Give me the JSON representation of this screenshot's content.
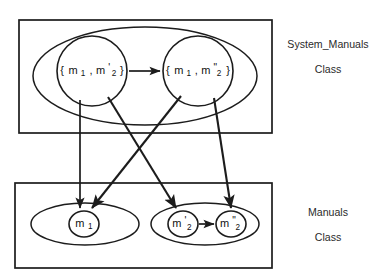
{
  "diagram": {
    "type": "set-mapping-diagram",
    "stroke_color": "#1c1c1c",
    "background_color": "#ffffff",
    "containers": [
      {
        "id": "system-manuals-box",
        "label_line1": "System_Manuals",
        "label_line2": "Class"
      },
      {
        "id": "manuals-box",
        "label_line1": "Manuals",
        "label_line2": "Class"
      }
    ],
    "nodes": {
      "top_left": {
        "id": "set-m1-m2prime",
        "open_brace": "{",
        "close_brace": "}",
        "base1": "m",
        "sub1": "1",
        "separator": ",",
        "base2": "m",
        "prime2": "'",
        "sub2": "2"
      },
      "top_right": {
        "id": "set-m1-m2doubleprime",
        "open_brace": "{",
        "close_brace": "}",
        "base1": "m",
        "sub1": "1",
        "separator": ",",
        "base2": "m",
        "prime2": "\"",
        "sub2": "2"
      },
      "bottom_left": {
        "id": "element-m1",
        "base": "m",
        "prime": "",
        "sub": "1"
      },
      "bottom_mid": {
        "id": "element-m2prime",
        "base": "m",
        "prime": "'",
        "sub": "2"
      },
      "bottom_right": {
        "id": "element-m2doubleprime",
        "base": "m",
        "prime": "\"",
        "sub": "2"
      }
    },
    "arrows": [
      {
        "id": "top-set-transition",
        "from": "top_left",
        "to": "top_right"
      },
      {
        "id": "top-left-to-m1",
        "from": "top_left",
        "to": "bottom_left"
      },
      {
        "id": "top-right-to-m1",
        "from": "top_right",
        "to": "bottom_left"
      },
      {
        "id": "top-left-to-m2prime",
        "from": "top_left",
        "to": "bottom_mid"
      },
      {
        "id": "top-right-to-m2doubleprime",
        "from": "top_right",
        "to": "bottom_right"
      },
      {
        "id": "bottom-element-transition",
        "from": "bottom_mid",
        "to": "bottom_right"
      }
    ]
  }
}
